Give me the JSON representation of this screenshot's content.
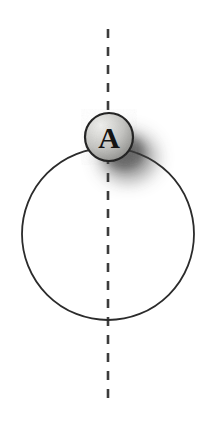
{
  "figure": {
    "canvas": {
      "width": 213,
      "height": 423,
      "background": "#ffffff"
    },
    "elements": {
      "loop": {
        "name": "large circle",
        "cx": 108,
        "cy": 234,
        "r": 86,
        "stroke_color": "#2b2b2b",
        "stroke_width": 1.8,
        "fill": "none"
      },
      "ball": {
        "name": "ball A",
        "label": "A",
        "cx": 109,
        "cy": 137,
        "r": 24,
        "stroke_color": "#1e1e1e",
        "stroke_width": 2,
        "fill_light": "#e6e6e4",
        "fill_mid": "#b9b9b6",
        "fill_dark": "#828280",
        "label_color": "#141414"
      },
      "shadow": {
        "name": "ball shadow",
        "cx": 127,
        "cy": 155,
        "rx": 27,
        "ry": 23,
        "color": "#3a3a3a",
        "blur": 9
      },
      "axis": {
        "name": "vertical dashed axis",
        "x": 108,
        "y_top": 29,
        "y_bottom": 398,
        "stroke_color": "#3c3c3c",
        "stroke_width": 2.6,
        "dash": 9,
        "gap": 9
      }
    }
  }
}
